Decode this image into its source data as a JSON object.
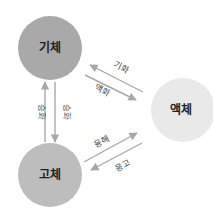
{
  "diagram": {
    "title": "",
    "nodes": [
      {
        "id": "gas",
        "label": "기체",
        "color": "#a9a9a9"
      },
      {
        "id": "liquid",
        "label": "액체",
        "color": "#e9e9e9"
      },
      {
        "id": "solid",
        "label": "고체",
        "color": "#bdbdbd"
      }
    ],
    "edges": [
      {
        "from": "solid",
        "to": "gas",
        "label": "승화"
      },
      {
        "from": "gas",
        "to": "solid",
        "label": "승화"
      },
      {
        "from": "liquid",
        "to": "gas",
        "label": "기화"
      },
      {
        "from": "gas",
        "to": "liquid",
        "label": "액화"
      },
      {
        "from": "solid",
        "to": "liquid",
        "label": "융해"
      },
      {
        "from": "liquid",
        "to": "solid",
        "label": "응고"
      }
    ],
    "arrow_color": "#a8a8a8"
  }
}
